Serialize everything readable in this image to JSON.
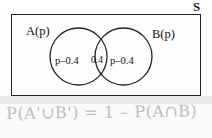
{
  "diagram": {
    "universal_set_label": "S",
    "sets": [
      {
        "name": "set-a",
        "label": "A(p)"
      },
      {
        "name": "set-b",
        "label": "B(p)"
      }
    ],
    "regions": [
      {
        "name": "a-only",
        "label": "p–0.4"
      },
      {
        "name": "intersection",
        "label": "0.4"
      },
      {
        "name": "b-only",
        "label": "p–0.4"
      }
    ],
    "colors": {
      "ink": "#242424",
      "text": "#111111",
      "pencil": "#b9b9b9",
      "background": "#fdfdfd"
    }
  },
  "working": {
    "equation": "P(A'∪B') = 1 – P(A∩B)"
  }
}
